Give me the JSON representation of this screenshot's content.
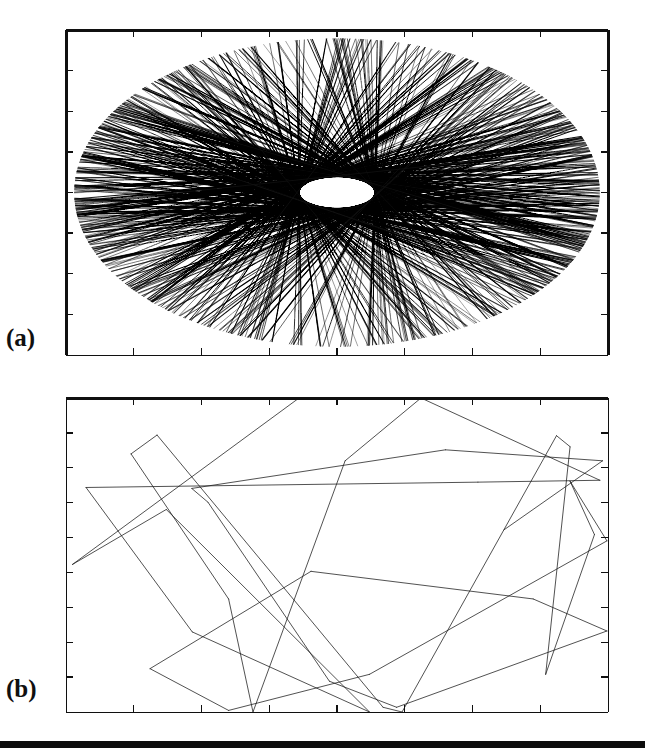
{
  "figure": {
    "type": "scientific-figure",
    "background_color": "#ffffff",
    "ink_color": "#101010",
    "page_rule": {
      "present": true,
      "color": "#0d0d0d",
      "thickness_px": 7
    }
  },
  "labels": {
    "panel_a": "(a)",
    "panel_b": "(b)"
  },
  "chart_data": [
    {
      "id": "panel-a",
      "type": "line",
      "title": "(a)",
      "subtitle": "",
      "xlabel": "",
      "ylabel": "",
      "xlim": [
        0,
        1
      ],
      "ylim": [
        0,
        1
      ],
      "grid": false,
      "legend": "none",
      "annotations": [],
      "axis": {
        "frame": "box",
        "tick_direction": "in",
        "x_major_ticks": 8,
        "y_major_ticks": 8,
        "x_tick_labels": [],
        "y_tick_labels": [],
        "top_border_weight": 3,
        "left_border_weight": 3,
        "right_border_weight": 3,
        "bottom_border_weight": 1
      },
      "content": {
        "kind": "chord-bundle",
        "description": "Dense set of straight chords confined to an elliptical caustic region, typical of an integrable elliptic billiard orbit.",
        "chord_count": 420,
        "envelope": {
          "shape": "ellipse",
          "cx_frac": 0.5,
          "cy_frac": 0.5,
          "rx_frac": 0.485,
          "ry_frac": 0.475
        },
        "inner_caustic": {
          "shape": "ellipse",
          "rx_frac": 0.07,
          "ry_frac": 0.05
        },
        "line_width": 0.85,
        "line_color": "#141414",
        "fill_density": "high",
        "random_seed": 20117
      }
    },
    {
      "id": "panel-b",
      "type": "line",
      "title": "(b)",
      "subtitle": "",
      "xlabel": "",
      "ylabel": "",
      "xlim": [
        0,
        1
      ],
      "ylim": [
        0,
        1
      ],
      "grid": false,
      "legend": "none",
      "annotations": [],
      "axis": {
        "frame": "box",
        "tick_direction": "in",
        "x_major_ticks": 8,
        "y_major_ticks": 9,
        "x_tick_labels": [],
        "y_tick_labels": [],
        "top_border_weight": 3,
        "left_border_weight": 1,
        "right_border_weight": 1,
        "bottom_border_weight": 1
      },
      "content": {
        "kind": "polyline-trajectory",
        "description": "Sparse single billiard trajectory reflecting specularly off the rectangular boundary, leaving long straight legs and sharp vertices at the walls.",
        "segment_count": 34,
        "line_width": 0.8,
        "line_color": "#1a1a1a",
        "vertices_normalized": [
          [
            0.43,
            0.0
          ],
          [
            0.012,
            0.53
          ],
          [
            0.185,
            0.355
          ],
          [
            0.56,
            1.0
          ],
          [
            0.233,
            0.745
          ],
          [
            0.037,
            0.285
          ],
          [
            0.76,
            0.268
          ],
          [
            0.985,
            0.262
          ],
          [
            0.655,
            0.0
          ],
          [
            0.515,
            0.2
          ],
          [
            0.345,
            1.0
          ],
          [
            0.3,
            0.64
          ],
          [
            0.12,
            0.178
          ],
          [
            0.168,
            0.118
          ],
          [
            0.585,
            0.985
          ],
          [
            0.62,
            1.0
          ],
          [
            0.905,
            0.12
          ],
          [
            0.93,
            0.155
          ],
          [
            0.885,
            0.88
          ],
          [
            0.975,
            0.435
          ],
          [
            0.93,
            0.265
          ],
          [
            0.998,
            0.455
          ],
          [
            0.56,
            0.88
          ],
          [
            0.3,
            0.995
          ],
          [
            0.155,
            0.862
          ],
          [
            0.452,
            0.552
          ],
          [
            0.862,
            0.64
          ],
          [
            0.998,
            0.742
          ],
          [
            0.61,
            0.985
          ],
          [
            0.486,
            0.902
          ],
          [
            0.262,
            0.332
          ],
          [
            0.232,
            0.288
          ],
          [
            0.7,
            0.165
          ],
          [
            0.99,
            0.2
          ],
          [
            0.808,
            0.42
          ]
        ]
      }
    }
  ]
}
